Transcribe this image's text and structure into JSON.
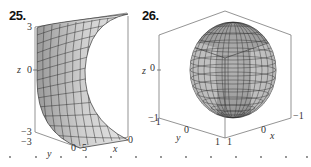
{
  "figures": [
    {
      "number": "25.",
      "surface": "half-cylinder (concave) surface",
      "axes": {
        "z_label": "z",
        "y_label": "y",
        "x_label": "x",
        "z_ticks": [
          "3",
          "0",
          "−3"
        ],
        "y_ticks": [
          "−3",
          "0"
        ],
        "x_ticks": [
          "5",
          "0"
        ]
      }
    },
    {
      "number": "26.",
      "surface": "sphere-like surface",
      "axes": {
        "z_label": "z",
        "y_label": "y",
        "x_label": "x",
        "z_ticks": [
          "0",
          "−1"
        ],
        "y_ticks": [
          "−1",
          "0",
          "1"
        ],
        "x_ticks": [
          "1",
          "0",
          "−1"
        ]
      }
    }
  ],
  "colors": {
    "surface_fill": "#c8c8c8",
    "surface_dark": "#8a8a8a",
    "grid_line": "#333333",
    "box_line": "#555555"
  }
}
